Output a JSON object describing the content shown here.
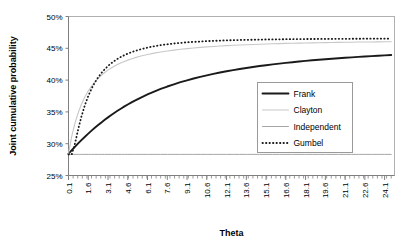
{
  "chart_data": {
    "type": "line",
    "title": "",
    "xlabel": "Theta",
    "ylabel": "Joint cumulative probability",
    "xlim": [
      0.1,
      24.85
    ],
    "ylim": [
      0.25,
      0.5
    ],
    "grid": false,
    "legend_position": "inside-right",
    "x_tick_labels": [
      "0.1",
      "1.6",
      "3.1",
      "4.6",
      "6.1",
      "7.6",
      "9.1",
      "10.6",
      "12.1",
      "13.6",
      "15.1",
      "16.6",
      "18.1",
      "19.6",
      "21.1",
      "22.6",
      "24.1"
    ],
    "x_tick_values": [
      0.1,
      1.6,
      3.1,
      4.6,
      6.1,
      7.6,
      9.1,
      10.6,
      12.1,
      13.6,
      15.1,
      16.6,
      18.1,
      19.6,
      21.1,
      22.6,
      24.1
    ],
    "x_minor_step": 0.35,
    "y_tick_labels": [
      "25%",
      "30%",
      "35%",
      "40%",
      "45%",
      "50%"
    ],
    "y_tick_values": [
      0.25,
      0.3,
      0.35,
      0.4,
      0.45,
      0.5
    ],
    "x": [
      0.1,
      0.35,
      0.6,
      0.85,
      1.1,
      1.35,
      1.6,
      1.85,
      2.1,
      2.35,
      2.6,
      2.85,
      3.1,
      3.35,
      3.6,
      3.85,
      4.1,
      4.35,
      4.6,
      4.85,
      5.1,
      5.6,
      6.1,
      6.6,
      7.1,
      7.6,
      8.1,
      8.6,
      9.1,
      9.6,
      10.1,
      10.6,
      11.1,
      11.6,
      12.1,
      12.6,
      13.1,
      13.6,
      14.1,
      14.6,
      15.1,
      15.6,
      16.1,
      16.6,
      17.1,
      17.6,
      18.1,
      18.6,
      19.1,
      19.6,
      20.1,
      20.6,
      21.1,
      21.6,
      22.1,
      22.6,
      23.1,
      23.6,
      24.1,
      24.6
    ],
    "series": [
      {
        "name": "Frank",
        "style": "solid",
        "color": "#1a1a1a",
        "width": 1.9,
        "values": [
          0.2845,
          0.29,
          0.2955,
          0.3008,
          0.306,
          0.311,
          0.3158,
          0.3205,
          0.325,
          0.3293,
          0.3335,
          0.3375,
          0.3414,
          0.3451,
          0.3487,
          0.3521,
          0.3554,
          0.3586,
          0.3616,
          0.3645,
          0.3673,
          0.3726,
          0.3775,
          0.382,
          0.3861,
          0.3899,
          0.3934,
          0.3967,
          0.3997,
          0.4025,
          0.4051,
          0.4075,
          0.4098,
          0.4119,
          0.4139,
          0.4157,
          0.4175,
          0.4191,
          0.4206,
          0.4221,
          0.4234,
          0.4247,
          0.4259,
          0.4271,
          0.4281,
          0.4292,
          0.4302,
          0.4311,
          0.432,
          0.4328,
          0.4336,
          0.4344,
          0.4351,
          0.4358,
          0.4365,
          0.4371,
          0.4377,
          0.4383,
          0.4389,
          0.4394
        ]
      },
      {
        "name": "Clayton",
        "style": "solid",
        "color": "#c8c8c8",
        "width": 1.1,
        "values": [
          0.2845,
          0.312,
          0.333,
          0.3495,
          0.3628,
          0.3737,
          0.3828,
          0.3905,
          0.397,
          0.4027,
          0.4076,
          0.4119,
          0.4157,
          0.4191,
          0.4221,
          0.4248,
          0.4272,
          0.4294,
          0.4314,
          0.4332,
          0.4349,
          0.4378,
          0.4403,
          0.4424,
          0.4442,
          0.4458,
          0.4472,
          0.4484,
          0.4495,
          0.4505,
          0.4514,
          0.4522,
          0.4529,
          0.4536,
          0.4542,
          0.4547,
          0.4552,
          0.4556,
          0.456,
          0.4564,
          0.4568,
          0.4571,
          0.4574,
          0.4577,
          0.4579,
          0.4582,
          0.4584,
          0.4586,
          0.4588,
          0.459,
          0.4592,
          0.4593,
          0.4595,
          0.4596,
          0.4598,
          0.4599,
          0.46,
          0.4601,
          0.4602,
          0.4603
        ]
      },
      {
        "name": "Independent",
        "style": "solid",
        "color": "#a6a6a6",
        "width": 1.0,
        "values": [
          0.2832,
          0.2832,
          0.2832,
          0.2832,
          0.2832,
          0.2832,
          0.2832,
          0.2832,
          0.2832,
          0.2832,
          0.2832,
          0.2832,
          0.2832,
          0.2832,
          0.2832,
          0.2832,
          0.2832,
          0.2832,
          0.2832,
          0.2832,
          0.2832,
          0.2832,
          0.2832,
          0.2832,
          0.2832,
          0.2832,
          0.2832,
          0.2832,
          0.2832,
          0.2832,
          0.2832,
          0.2832,
          0.2832,
          0.2832,
          0.2832,
          0.2832,
          0.2832,
          0.2832,
          0.2832,
          0.2832,
          0.2832,
          0.2832,
          0.2832,
          0.2832,
          0.2832,
          0.2832,
          0.2832,
          0.2832,
          0.2832,
          0.2832,
          0.2832,
          0.2832,
          0.2832,
          0.2832,
          0.2832,
          0.2832,
          0.2832,
          0.2832,
          0.2832,
          0.2832
        ]
      },
      {
        "name": "Gumbel",
        "style": "dotted",
        "color": "#1a1a1a",
        "width": 1.8,
        "values": [
          0.2832,
          0.2832,
          0.301,
          0.324,
          0.344,
          0.361,
          0.375,
          0.3866,
          0.3962,
          0.4043,
          0.4112,
          0.4171,
          0.4222,
          0.4266,
          0.4304,
          0.4338,
          0.4367,
          0.4393,
          0.4416,
          0.4437,
          0.4455,
          0.4486,
          0.4511,
          0.4532,
          0.4549,
          0.4563,
          0.4575,
          0.4585,
          0.4594,
          0.4601,
          0.4607,
          0.4613,
          0.4617,
          0.4621,
          0.4625,
          0.4628,
          0.4631,
          0.4633,
          0.4635,
          0.4637,
          0.4639,
          0.464,
          0.4641,
          0.4643,
          0.4644,
          0.4645,
          0.4646,
          0.4646,
          0.4647,
          0.4648,
          0.4648,
          0.4649,
          0.4649,
          0.465,
          0.465,
          0.4651,
          0.4651,
          0.4651,
          0.4652,
          0.4652
        ]
      }
    ]
  },
  "legend": {
    "entries": [
      {
        "label": "Frank"
      },
      {
        "label": "Clayton"
      },
      {
        "label": "Independent"
      },
      {
        "label": "Gumbel"
      }
    ]
  },
  "colors": {
    "frank": "#1a1a1a",
    "clayton": "#c8c8c8",
    "independent": "#a6a6a6",
    "gumbel": "#1a1a1a",
    "axis": "#808080",
    "frame": "#b0b0b0",
    "text": "#000000"
  }
}
